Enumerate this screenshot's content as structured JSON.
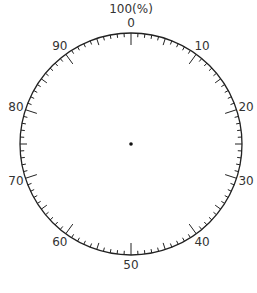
{
  "diagram": {
    "title": "100(%)",
    "type": "percentage-circle-dial",
    "center": {
      "x": 131,
      "y": 144
    },
    "radius": 111,
    "divisions": 100,
    "major_every": 10,
    "mid_every": 5,
    "colors": {
      "line": "#222222",
      "text": "#333333",
      "background": "#ffffff"
    },
    "labels": [
      "0",
      "10",
      "20",
      "30",
      "40",
      "50",
      "60",
      "70",
      "80",
      "90"
    ],
    "center_dot": true
  }
}
